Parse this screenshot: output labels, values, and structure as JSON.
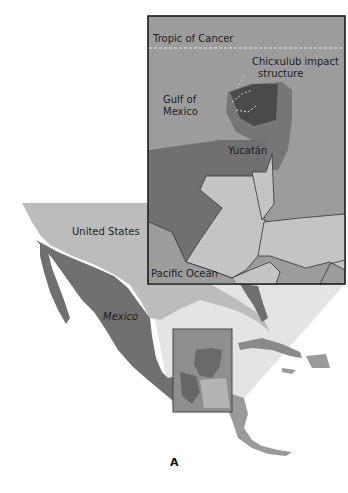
{
  "figure": {
    "panel_label": "A",
    "inset": {
      "labels": {
        "tropic": "Tropic of Cancer",
        "chicxulub_line1": "Chicxulub impact",
        "chicxulub_line2": "structure",
        "gulf_line1": "Gulf of",
        "gulf_line2": "Mexico",
        "yucatan": "Yucatán",
        "pacific": "Pacific Ocean"
      }
    },
    "main_map": {
      "labels": {
        "united_states": "United States",
        "mexico": "Mexico"
      }
    },
    "colors": {
      "ocean": "#9a9a9a",
      "land_light": "#c4c4c4",
      "land_dark": "#6e6e6e",
      "crater": "#4a4a4a",
      "us_land": "#b8b8b8",
      "zoom_wedge": "#e2e2e2",
      "border": "#333333"
    }
  }
}
